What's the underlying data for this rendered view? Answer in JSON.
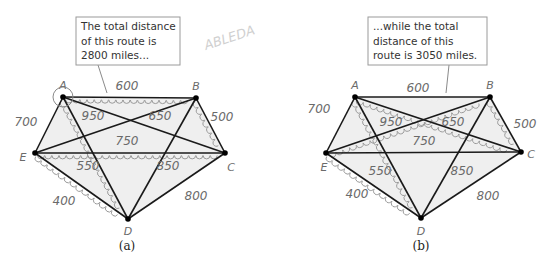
{
  "watermark": "ABLEDA",
  "vertices": [
    "A",
    "B",
    "C",
    "D",
    "E"
  ],
  "edges": [
    {
      "from": "A",
      "to": "B",
      "weight": "600"
    },
    {
      "from": "B",
      "to": "C",
      "weight": "500"
    },
    {
      "from": "C",
      "to": "D",
      "weight": "800"
    },
    {
      "from": "D",
      "to": "E",
      "weight": "400"
    },
    {
      "from": "E",
      "to": "A",
      "weight": "700"
    },
    {
      "from": "A",
      "to": "C",
      "weight": "650"
    },
    {
      "from": "A",
      "to": "D",
      "weight": "550"
    },
    {
      "from": "B",
      "to": "E",
      "weight": "950"
    },
    {
      "from": "B",
      "to": "D",
      "weight": "850"
    },
    {
      "from": "C",
      "to": "E",
      "weight": "750"
    }
  ],
  "panels": [
    {
      "caption": "(a)",
      "callout": [
        "The total distance",
        "of this route is",
        "2800 miles..."
      ],
      "route": [
        "A",
        "B",
        "C",
        "E",
        "D",
        "A"
      ],
      "total_miles": 2800
    },
    {
      "caption": "(b)",
      "callout": [
        "...while the total",
        "distance  of this",
        "route is 3050 miles."
      ],
      "route": [
        "A",
        "C",
        "B",
        "E",
        "D",
        "A"
      ],
      "total_miles": 3050
    }
  ]
}
